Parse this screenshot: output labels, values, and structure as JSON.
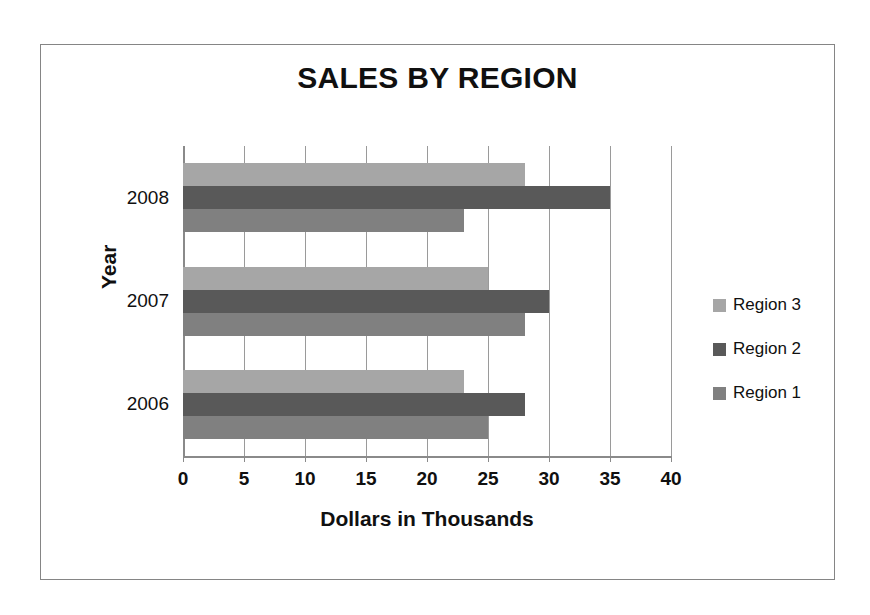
{
  "chart_data": {
    "type": "bar",
    "orientation": "horizontal",
    "title": "SALES BY REGION",
    "xlabel": "Dollars in Thousands",
    "ylabel": "Year",
    "categories": [
      "2008",
      "2007",
      "2006"
    ],
    "series": [
      {
        "name": "Region 1",
        "color": "#808080",
        "values": [
          23,
          28,
          25
        ]
      },
      {
        "name": "Region 2",
        "color": "#595959",
        "values": [
          35,
          30,
          28
        ]
      },
      {
        "name": "Region 3",
        "color": "#a6a6a6",
        "values": [
          28,
          25,
          23
        ]
      }
    ],
    "series_draw_order_top_to_bottom": [
      "Region 3",
      "Region 2",
      "Region 1"
    ],
    "xlim": [
      0,
      40
    ],
    "xticks": [
      0,
      5,
      10,
      15,
      20,
      25,
      30,
      35,
      40
    ],
    "xtick_labels": [
      "0",
      "5",
      "10",
      "15",
      "20",
      "25",
      "30",
      "35",
      "40"
    ],
    "grid": {
      "vertical": true,
      "horizontal": false
    },
    "legend": {
      "position": "right",
      "entries": [
        {
          "label": "Region 3",
          "color": "#a6a6a6"
        },
        {
          "label": "Region 2",
          "color": "#595959"
        },
        {
          "label": "Region 1",
          "color": "#808080"
        }
      ]
    },
    "border_color": "#858585",
    "gridline_color": "#9a9a9a",
    "background": "#ffffff"
  }
}
